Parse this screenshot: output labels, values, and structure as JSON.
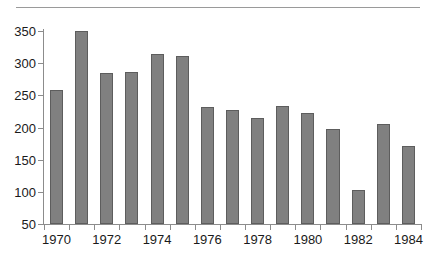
{
  "chart_data": {
    "type": "bar",
    "title": "",
    "subtitle": "",
    "xlabel": "",
    "ylabel": "",
    "categories": [
      "1970",
      "1971",
      "1972",
      "1973",
      "1974",
      "1975",
      "1976",
      "1977",
      "1978",
      "1979",
      "1980",
      "1981",
      "1982",
      "1983",
      "1984"
    ],
    "values": [
      259,
      350,
      285,
      286,
      314,
      311,
      232,
      227,
      214,
      234,
      223,
      197,
      103,
      206,
      172
    ],
    "series": [
      {
        "name": "",
        "values": [
          259,
          350,
          285,
          286,
          314,
          311,
          232,
          227,
          214,
          234,
          223,
          197,
          103,
          206,
          172
        ]
      }
    ],
    "ylim": [
      50,
      350
    ],
    "yticks": [
      50,
      100,
      150,
      200,
      250,
      300,
      350
    ],
    "ytick_labels": [
      "50",
      "100",
      "150",
      "200",
      "250",
      "300",
      "350"
    ],
    "xtick_labels": [
      "1970",
      "1972",
      "1974",
      "1976",
      "1978",
      "1980",
      "1982",
      "1984"
    ],
    "xtick_categories": [
      "1970",
      "1972",
      "1974",
      "1976",
      "1978",
      "1980",
      "1982",
      "1984"
    ],
    "grid": false,
    "legend": null,
    "legend_position": "none",
    "bar_color": "#808080",
    "bar_edge_color": "#5d5d5d",
    "axis_color": "#8c8c8c",
    "text_color": "#1a1a1a",
    "rule_color": "#9a9a9a",
    "annotations": []
  }
}
